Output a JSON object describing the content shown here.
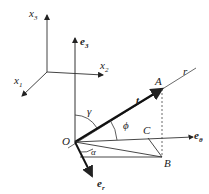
{
  "diagram": {
    "axes": {
      "x1": "x",
      "x1_sub": "1",
      "x2": "x",
      "x2_sub": "2",
      "x3": "x",
      "x3_sub": "3"
    },
    "vectors": {
      "e3": "e",
      "e3_sub": "3",
      "etheta": "e",
      "etheta_sub": "θ",
      "er": "e",
      "er_sub": "r",
      "t": "t"
    },
    "points": {
      "O": "O",
      "A": "A",
      "B": "B",
      "C": "C",
      "r": "r"
    },
    "angles": {
      "gamma": "γ",
      "phi": "ϕ",
      "alpha": "α"
    }
  }
}
